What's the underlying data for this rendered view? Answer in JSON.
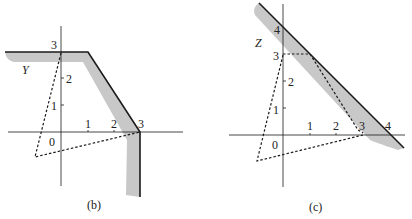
{
  "colors": {
    "ink": "#1a1a1a",
    "shade": "#c8c8c8",
    "background": "#ffffff"
  },
  "panels": [
    {
      "id": "b",
      "caption": "(b)",
      "region_label": "Y",
      "origin_label": "0",
      "x_ticks": [
        "1",
        "2",
        "3"
      ],
      "y_ticks": [
        "1",
        "2",
        "3"
      ]
    },
    {
      "id": "c",
      "caption": "(c)",
      "region_label": "Z",
      "origin_label": "0",
      "x_ticks": [
        "1",
        "2",
        "3",
        "4"
      ],
      "y_ticks": [
        "1",
        "2",
        "3",
        "4"
      ]
    }
  ]
}
